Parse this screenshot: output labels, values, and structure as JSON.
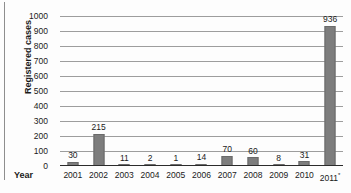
{
  "chart_data": {
    "type": "bar",
    "title": "",
    "xlabel": "Year",
    "ylabel": "Registered cases",
    "categories": [
      "2001",
      "2002",
      "2003",
      "2004",
      "2005",
      "2006",
      "2007",
      "2008",
      "2009",
      "2010",
      "2011*"
    ],
    "values": [
      30,
      215,
      11,
      2,
      1,
      14,
      70,
      60,
      8,
      31,
      936
    ],
    "data_labels": [
      "30",
      "215",
      "11",
      "2",
      "1",
      "14",
      "70",
      "60",
      "8",
      "31",
      "936"
    ],
    "ylim": [
      0,
      1000
    ],
    "yticks": [
      1000,
      900,
      800,
      700,
      600,
      500,
      400,
      300,
      200,
      100,
      0
    ],
    "ytick_labels": [
      "1000",
      "900",
      "800",
      "700",
      "600",
      "500",
      "400",
      "300",
      "200",
      "100",
      "0"
    ],
    "grid": "horizontal",
    "legend": "none",
    "bar_color": "#7d7d7d",
    "axis_color": "#2b2b2b",
    "gridline_color": "#9d9d9d",
    "text_color": "#1a1a1a",
    "background": "#fdfdfd",
    "footnote_marker": "*"
  }
}
